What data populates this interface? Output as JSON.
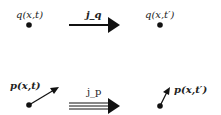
{
  "top": {
    "left_label": "q(x,t)",
    "arrow_label": "j_q",
    "right_label": "q(x,t′)"
  },
  "bottom": {
    "left_label": "p(x,t)",
    "arrow_label": "j_p",
    "right_label": "p(x,t′)"
  }
}
